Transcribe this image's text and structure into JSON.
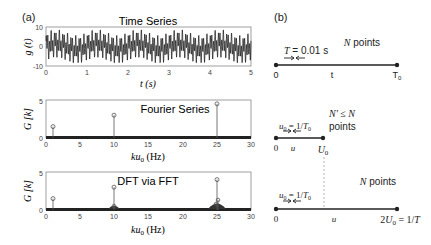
{
  "panel_a_label": "(a)",
  "panel_b_label": "(b)",
  "chart_data": [
    {
      "type": "line",
      "title": "Time Series",
      "xlabel": "t (s)",
      "ylabel": "g (t)",
      "xlim": [
        0,
        5
      ],
      "ylim": [
        -10,
        10
      ],
      "xticks": [
        "0",
        "1",
        "2",
        "3",
        "4",
        "5"
      ],
      "yticks": [
        "-10",
        "0",
        "10"
      ],
      "description": "Oscillating signal sum of sinusoids at 1, 10 and 25 Hz, amplitude roughly between -8 and 9"
    },
    {
      "type": "stem",
      "title": "Fourier Series",
      "xlabel": "ku0 (Hz)",
      "ylabel": "G [k]",
      "xlim": [
        0,
        30
      ],
      "ylim": [
        0,
        5
      ],
      "xticks": [
        "0",
        "5",
        "10",
        "15",
        "20",
        "25",
        "30"
      ],
      "yticks": [
        "0",
        "5"
      ],
      "x": [
        1,
        10,
        25
      ],
      "values": [
        1.5,
        3.0,
        4.5
      ]
    },
    {
      "type": "stem",
      "title": "DFT via FFT",
      "xlabel": "ku0 (Hz)",
      "ylabel": "G [k]",
      "xlim": [
        0,
        30
      ],
      "ylim": [
        0,
        5
      ],
      "xticks": [
        "0",
        "5",
        "10",
        "15",
        "20",
        "25",
        "30"
      ],
      "yticks": [
        "0",
        "5"
      ],
      "x": [
        1,
        10,
        25
      ],
      "values": [
        1.5,
        3.0,
        4.0
      ],
      "leakage_note": "small sidelobes around 10 and 25 Hz"
    }
  ],
  "diagram": {
    "row1": {
      "spacing_label": "T = 0.01 s",
      "count_label": "N points",
      "start": "0",
      "mid": "t",
      "end": "T0"
    },
    "row2": {
      "spacing_label": "u0 = 1/T0",
      "count_label_1": "N' ≤ N",
      "count_label_2": "points",
      "start": "0",
      "mid": "u",
      "end": "U0"
    },
    "row3": {
      "spacing_label": "u0 = 1/T0",
      "count_label": "N points",
      "start": "0",
      "mid": "u",
      "end": "2U0 = 1/T"
    }
  }
}
